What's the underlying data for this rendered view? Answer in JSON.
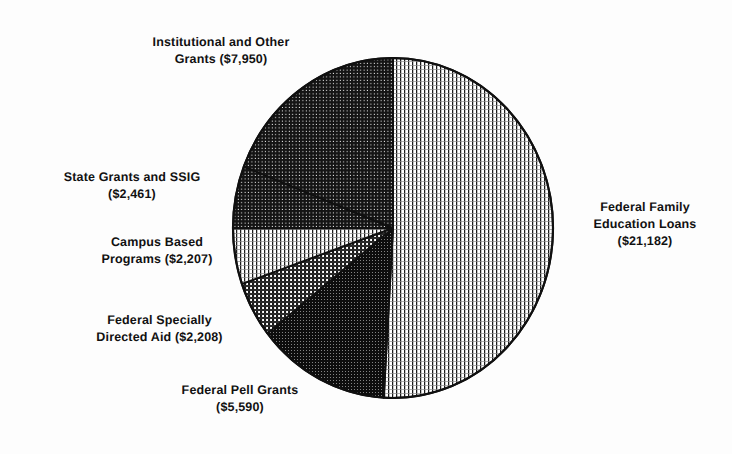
{
  "figure": {
    "background_color": "#fdfdfd",
    "ink_color": "#111111",
    "currency_unit": "millions of dollars"
  },
  "chart_data": {
    "type": "pie",
    "title": "",
    "subtitle": "",
    "xlabel": "",
    "ylabel": "",
    "legend_position": "none",
    "labels_position": "outside-callout",
    "grid": false,
    "total": 41598,
    "start_angle_deg": 0,
    "direction": "clockwise",
    "categories": [
      "Federal Family Education Loans",
      "Federal Pell Grants",
      "Federal Specially Directed Aid",
      "Campus Based Programs",
      "State Grants and SSIG",
      "Institutional and Other Grants"
    ],
    "values": [
      21182,
      5590,
      2208,
      2207,
      2461,
      7950
    ],
    "value_labels": [
      "$21,182",
      "$5,590",
      "$2,208",
      "$2,207",
      "$2,461",
      "$7,950"
    ],
    "percents": [
      50.92,
      13.44,
      5.31,
      5.31,
      5.92,
      19.11
    ],
    "slices": [
      {
        "name": "Federal Family Education Loans",
        "value": 21182,
        "value_label": "$21,182",
        "percent": 50.92,
        "start_deg": 0.0,
        "end_deg": 183.32,
        "fill": "fine-vertical-lines",
        "shade": "light"
      },
      {
        "name": "Federal Pell Grants",
        "value": 5590,
        "value_label": "$5,590",
        "percent": 13.44,
        "start_deg": 183.32,
        "end_deg": 231.7,
        "fill": "dense-dark-grid",
        "shade": "very-dark"
      },
      {
        "name": "Federal Specially Directed Aid",
        "value": 2208,
        "value_label": "$2,208",
        "percent": 5.31,
        "start_deg": 231.7,
        "end_deg": 250.81,
        "fill": "medium-crosshatch",
        "shade": "medium-dark"
      },
      {
        "name": "Campus Based Programs",
        "value": 2207,
        "value_label": "$2,207",
        "percent": 5.31,
        "start_deg": 250.81,
        "end_deg": 269.91,
        "fill": "fine-vertical-lines",
        "shade": "light"
      },
      {
        "name": "State Grants and SSIG",
        "value": 2461,
        "value_label": "$2,461",
        "percent": 5.92,
        "start_deg": 269.91,
        "end_deg": 291.21,
        "fill": "dense-dark-grid",
        "shade": "dark"
      },
      {
        "name": "Institutional and Other Grants",
        "value": 7950,
        "value_label": "$7,950",
        "percent": 19.11,
        "start_deg": 291.21,
        "end_deg": 360.0,
        "fill": "dense-dark-grid",
        "shade": "dark"
      }
    ]
  },
  "labels": {
    "institutional": {
      "line1": "Institutional and Other",
      "line2": "Grants ($7,950)",
      "text": "Institutional and Other\nGrants ($7,950)"
    },
    "state_grants": {
      "line1": "State Grants and SSIG",
      "line2": "($2,461)",
      "text": "State Grants and SSIG\n($2,461)"
    },
    "campus_based": {
      "line1": "Campus Based",
      "line2": "Programs ($2,207)",
      "text": "Campus Based\nPrograms ($2,207)"
    },
    "federal_specially": {
      "line1": "Federal Specially",
      "line2": "Directed Aid ($2,208)",
      "text": "Federal Specially\nDirected Aid ($2,208)"
    },
    "federal_pell": {
      "line1": "Federal Pell Grants",
      "line2": "($5,590)",
      "text": "Federal Pell Grants\n($5,590)"
    },
    "ffel": {
      "line1": "Federal Family",
      "line2": "Education Loans",
      "line3": "($21,182)",
      "text": "Federal Family\nEducation Loans\n($21,182)"
    }
  }
}
